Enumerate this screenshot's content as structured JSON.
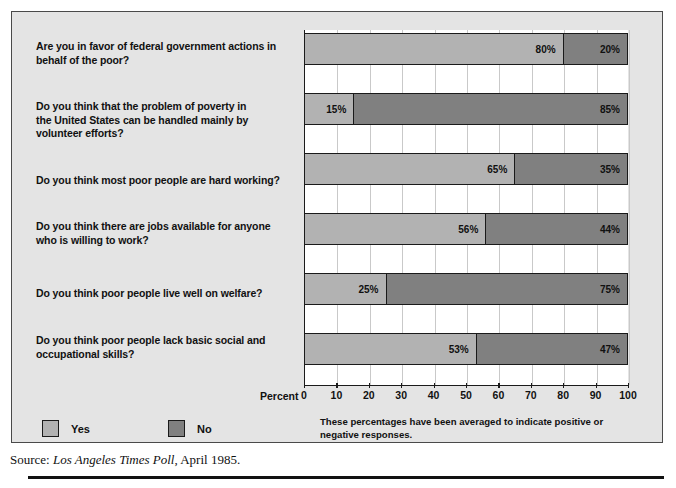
{
  "chart_data": {
    "type": "bar",
    "orientation": "horizontal",
    "stacked": true,
    "categories": [
      "Are you in favor of federal government actions in behalf of the poor?",
      "Do you think that the problem of poverty in the United States can be handled mainly by volunteer efforts?",
      "Do you think most poor people are hard working?",
      "Do you think there are jobs available for anyone who is willing to work?",
      "Do you think poor people live well on welfare?",
      "Do you think poor people lack basic social and occupational skills?"
    ],
    "series": [
      {
        "name": "Yes",
        "values": [
          80,
          15,
          65,
          56,
          25,
          53
        ],
        "color": "#b2b2b2"
      },
      {
        "name": "No",
        "values": [
          20,
          85,
          35,
          44,
          75,
          47
        ],
        "color": "#808080"
      }
    ],
    "value_labels": [
      {
        "yes": "80%",
        "no": "20%"
      },
      {
        "yes": "15%",
        "no": "85%"
      },
      {
        "yes": "65%",
        "no": "35%"
      },
      {
        "yes": "56%",
        "no": "44%"
      },
      {
        "yes": "25%",
        "no": "75%"
      },
      {
        "yes": "53%",
        "no": "47%"
      }
    ],
    "title": "",
    "xlabel": "Percent",
    "ylabel": "",
    "xlim": [
      0,
      100
    ],
    "xticks": [
      0,
      10,
      20,
      30,
      40,
      50,
      60,
      70,
      80,
      90,
      100
    ],
    "xtick_labels": [
      "0",
      "10",
      "20",
      "30",
      "40",
      "50",
      "60",
      "70",
      "80",
      "90",
      "100"
    ],
    "grid": true,
    "legend_position": "bottom-left"
  },
  "questions": [
    {
      "id": "q1",
      "lines": [
        "Are you in favor of federal government actions in",
        "behalf of the poor?"
      ]
    },
    {
      "id": "q2",
      "lines": [
        "Do you think that the problem of poverty in",
        "the United States can be handled mainly by",
        "volunteer efforts?"
      ]
    },
    {
      "id": "q3",
      "lines": [
        "Do you think most poor people are hard working?"
      ]
    },
    {
      "id": "q4",
      "lines": [
        "Do you think there are jobs available for anyone",
        "who is willing to work?"
      ]
    },
    {
      "id": "q5",
      "lines": [
        "Do you think poor people live well on welfare?"
      ]
    },
    {
      "id": "q6",
      "lines": [
        "Do you think poor people lack basic social and",
        "occupational skills?"
      ]
    }
  ],
  "axis": {
    "caption": "Percent",
    "ticks": [
      "0",
      "10",
      "20",
      "30",
      "40",
      "50",
      "60",
      "70",
      "80",
      "90",
      "100"
    ]
  },
  "legend": {
    "items": [
      {
        "label": "Yes",
        "color": "#b2b2b2"
      },
      {
        "label": "No",
        "color": "#808080"
      }
    ]
  },
  "note": {
    "line1": "These percentages have been averaged to indicate positive or",
    "line2": "negative responses."
  },
  "source": {
    "prefix": "Source: ",
    "italic": "Los Angeles Times Poll",
    "suffix": ", April 1985."
  },
  "colors": {
    "yes": "#b2b2b2",
    "no": "#808080",
    "panel_bg": "#e4e4e4",
    "plot_bg": "#ffffff",
    "gridline": "#c9c9c9",
    "ink": "#111111"
  }
}
